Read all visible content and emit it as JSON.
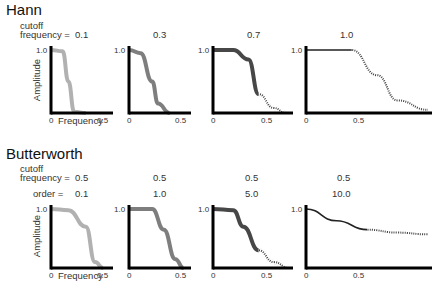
{
  "hann": {
    "title": "Hann",
    "cutoff_label": "cutoff",
    "frequency_label": "frequency =",
    "panels": [
      {
        "cutoff": "0.1"
      },
      {
        "cutoff": "0.3"
      },
      {
        "cutoff": "0.7"
      },
      {
        "cutoff": "1.0"
      }
    ]
  },
  "butterworth": {
    "title": "Butterworth",
    "cutoff_label": "cutoff",
    "frequency_label": "frequency =",
    "order_label": "order  =",
    "panels": [
      {
        "cutoff": "0.5",
        "order": "0.1"
      },
      {
        "cutoff": "0.5",
        "order": "1.0"
      },
      {
        "cutoff": "0.5",
        "order": "5.0"
      },
      {
        "cutoff": "0.5",
        "order": "10.0"
      }
    ]
  },
  "axes": {
    "ylabel": "Amplitude",
    "xlabel": "Frequency",
    "y_tick": "1.0",
    "x_tick_0": "0",
    "x_tick_05": "0.5"
  },
  "chart_data": [
    {
      "type": "line",
      "title": "Hann cutoff 0.1",
      "xlabel": "Frequency",
      "ylabel": "Amplitude",
      "x": [
        0,
        0.1,
        0.15,
        0.2,
        0.3
      ],
      "values": [
        1,
        0.98,
        0.5,
        0.02,
        0
      ],
      "color": "#a8a8a8",
      "band": true
    },
    {
      "type": "line",
      "title": "Hann cutoff 0.3",
      "xlabel": "Frequency",
      "ylabel": "Amplitude",
      "x": [
        0,
        0.1,
        0.2,
        0.25,
        0.35
      ],
      "values": [
        1,
        0.95,
        0.5,
        0.15,
        0
      ],
      "color": "#707070",
      "band": true
    },
    {
      "type": "line",
      "title": "Hann cutoff 0.7",
      "xlabel": "Frequency",
      "ylabel": "Amplitude",
      "x": [
        0,
        0.2,
        0.35,
        0.45,
        0.6,
        0.72
      ],
      "values": [
        1,
        1,
        0.85,
        0.3,
        0.08,
        0
      ],
      "color": "#333333",
      "band": true,
      "dotted_after": 0.45
    },
    {
      "type": "line",
      "title": "Hann cutoff 1.0",
      "xlabel": "Frequency",
      "ylabel": "Amplitude",
      "x": [
        0,
        0.45,
        0.7,
        0.9,
        1.2
      ],
      "values": [
        1,
        1,
        0.6,
        0.2,
        0.05
      ],
      "color": "#222222",
      "band": false,
      "dotted_after": 0.45
    },
    {
      "type": "line",
      "title": "Butterworth cutoff 0.5 order 0.1",
      "xlabel": "Frequency",
      "ylabel": "Amplitude",
      "x": [
        0,
        0.15,
        0.3,
        0.38,
        0.45
      ],
      "values": [
        1,
        0.98,
        0.7,
        0.1,
        0
      ],
      "color": "#a8a8a8",
      "band": true
    },
    {
      "type": "line",
      "title": "Butterworth cutoff 0.5 order 1.0",
      "xlabel": "Frequency",
      "ylabel": "Amplitude",
      "x": [
        0,
        0.2,
        0.3,
        0.4,
        0.47
      ],
      "values": [
        1,
        1,
        0.65,
        0.15,
        0
      ],
      "color": "#707070",
      "band": true
    },
    {
      "type": "line",
      "title": "Butterworth cutoff 0.5 order 5.0",
      "xlabel": "Frequency",
      "ylabel": "Amplitude",
      "x": [
        0,
        0.2,
        0.3,
        0.45,
        0.6,
        0.75
      ],
      "values": [
        1,
        0.98,
        0.7,
        0.3,
        0.1,
        0
      ],
      "color": "#333333",
      "band": true,
      "dotted_after": 0.45
    },
    {
      "type": "line",
      "title": "Butterworth cutoff 0.5 order 10.0",
      "xlabel": "Frequency",
      "ylabel": "Amplitude",
      "x": [
        0,
        0.25,
        0.5,
        0.75,
        1.0
      ],
      "values": [
        1,
        0.8,
        0.65,
        0.6,
        0.57
      ],
      "color": "#222222",
      "band": false,
      "dotted_after": 0.5
    }
  ]
}
